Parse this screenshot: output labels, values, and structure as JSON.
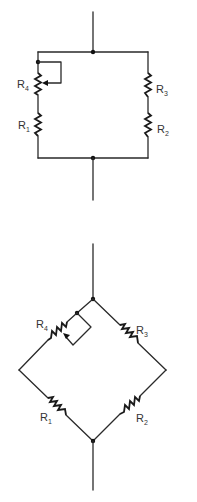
{
  "diagrams": [
    {
      "name": "parallel-arrangement",
      "labels": {
        "r4": {
          "main": "R",
          "sub": "4"
        },
        "r1": {
          "main": "R",
          "sub": "1"
        },
        "r3": {
          "main": "R",
          "sub": "3"
        },
        "r2": {
          "main": "R",
          "sub": "2"
        }
      }
    },
    {
      "name": "bridge-arrangement",
      "labels": {
        "r4": {
          "main": "R",
          "sub": "4"
        },
        "r1": {
          "main": "R",
          "sub": "1"
        },
        "r3": {
          "main": "R",
          "sub": "3"
        },
        "r2": {
          "main": "R",
          "sub": "2"
        }
      }
    }
  ],
  "colors": {
    "wire": "#2a2a2a",
    "background": "#ffffff"
  }
}
